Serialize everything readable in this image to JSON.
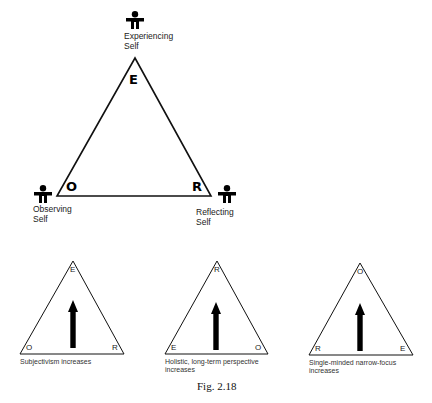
{
  "main_triangle": {
    "vertices": {
      "top": {
        "letter": "E",
        "label_line1": "Experiencing",
        "label_line2": "Self"
      },
      "left": {
        "letter": "O",
        "label_line1": "Observing",
        "label_line2": "Self"
      },
      "right": {
        "letter": "R",
        "label_line1": "Reflecting",
        "label_line2": "Self"
      }
    },
    "icon": "person-icon"
  },
  "small_triangles": [
    {
      "top": "E",
      "left": "O",
      "right": "R",
      "caption_line1": "Subjectivism increases",
      "caption_line2": ""
    },
    {
      "top": "R",
      "left": "E",
      "right": "O",
      "caption_line1": "Holistic, long-term perspective",
      "caption_line2": "increases"
    },
    {
      "top": "O",
      "left": "R",
      "right": "E",
      "caption_line1": "Single-minded narrow-focus",
      "caption_line2": "increases"
    }
  ],
  "figure_caption": "Fig. 2.18"
}
